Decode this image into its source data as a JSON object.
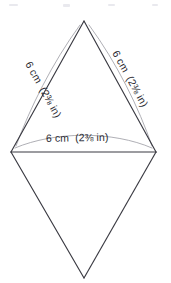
{
  "figure": {
    "shape_name": "rhombus",
    "stroke_color": "#3a3a42",
    "leader_color": "#9a9aa2",
    "background_color": "#ffffff",
    "vertices": {
      "top": {
        "x": 84,
        "y": 21
      },
      "left": {
        "x": 11,
        "y": 152
      },
      "right": {
        "x": 156,
        "y": 152
      },
      "bottom": {
        "x": 84,
        "y": 278
      }
    },
    "labels": {
      "left_side": "6 cm  (2⅜ in)",
      "right_side": "6 cm  (2⅜ in)",
      "horizontal_diagonal": "6 cm  (2⅜ in)"
    },
    "measurements": [
      {
        "edge": "left-upper-side",
        "metric": "6 cm",
        "imperial": "2⅜ in"
      },
      {
        "edge": "right-upper-side",
        "metric": "6 cm",
        "imperial": "2⅜ in"
      },
      {
        "edge": "horizontal-diagonal",
        "metric": "6 cm",
        "imperial": "2⅜ in"
      }
    ]
  }
}
